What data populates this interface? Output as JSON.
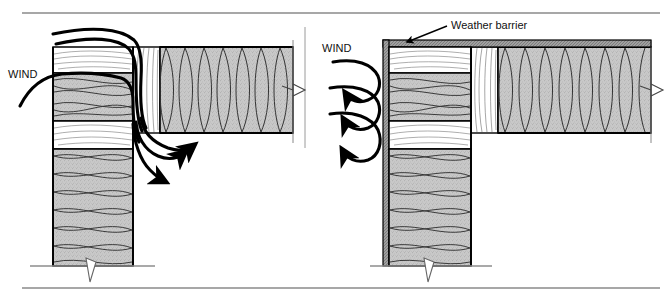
{
  "figure": {
    "name": "wind-washing-wall-section-comparison",
    "border_color": "#808080",
    "ink_color": "#000000",
    "insulation_fill": "#c8c8c8",
    "wood_fill": "#ffffff",
    "barrier_fill": "#9a9a9a"
  },
  "panels": [
    {
      "id": "left",
      "name": "without-weather-barrier",
      "wind_label": "WIND",
      "wind_label_x": 8,
      "wind_label_y": 74,
      "arrow_behavior": "penetrating",
      "incoming_arrow_count": 3,
      "exiting_arrow_count": 3
    },
    {
      "id": "right",
      "name": "with-weather-barrier",
      "wind_label": "WIND",
      "wind_label_x": 322,
      "wind_label_y": 48,
      "callout_label": "Weather barrier",
      "callout_label_x": 451,
      "callout_label_y": 25,
      "arrow_behavior": "deflected",
      "incoming_arrow_count": 3,
      "exiting_arrow_count": 0
    }
  ],
  "rules": {
    "top_rule_y": 13,
    "bottom_rule_y": 288,
    "divider_x": 305,
    "divider_top": 27,
    "divider_bottom": 148
  },
  "geometry": {
    "left_wall": {
      "x": 53,
      "w": 80,
      "top": 47,
      "floor": 266
    },
    "left_ceiling": {
      "x": 133,
      "y": 47,
      "w": 160,
      "h": 86
    },
    "right_wall": {
      "x": 383,
      "w": 88,
      "top": 40,
      "floor": 266
    },
    "right_ceiling": {
      "x": 471,
      "y": 47,
      "w": 180,
      "h": 86
    },
    "barrier_thickness": 5
  }
}
